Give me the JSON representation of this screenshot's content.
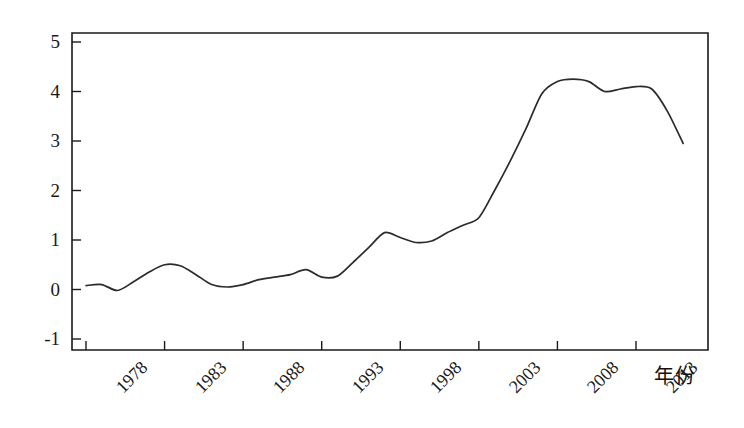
{
  "chart_data": {
    "type": "line",
    "title": "",
    "subtitle": "",
    "xlabel": "年份",
    "ylabel": "",
    "xlim": [
      1978,
      2016
    ],
    "ylim": [
      -1,
      5.2
    ],
    "grid": false,
    "legend": null,
    "legend_position": "none",
    "line_color": "#2b2b2b",
    "axis_color": "#1a1a1a",
    "background_color": "#ffffff",
    "yticks": [
      5,
      4,
      3,
      2,
      1,
      0,
      -1
    ],
    "ytick_labels": [
      "5",
      "4",
      "3",
      "2",
      "1",
      "0",
      "-1"
    ],
    "xticks": [
      1978,
      1983,
      1988,
      1993,
      1998,
      2003,
      2008,
      2013
    ],
    "xtick_labels": [
      "1978",
      "1983",
      "1988",
      "1993",
      "1998",
      "2003",
      "2008",
      "2013"
    ],
    "x": [
      1978,
      1979,
      1980,
      1981,
      1982,
      1983,
      1984,
      1985,
      1986,
      1987,
      1988,
      1989,
      1990,
      1991,
      1992,
      1993,
      1994,
      1995,
      1996,
      1997,
      1998,
      1999,
      2000,
      2001,
      2002,
      2003,
      2004,
      2005,
      2006,
      2007,
      2008,
      2009,
      2010,
      2011,
      2012,
      2013,
      2014,
      2015,
      2016
    ],
    "series": [
      {
        "name": "",
        "values": [
          0.08,
          0.1,
          -0.02,
          0.15,
          0.35,
          0.5,
          0.48,
          0.3,
          0.1,
          0.05,
          0.1,
          0.2,
          0.25,
          0.3,
          0.4,
          0.25,
          0.27,
          0.55,
          0.85,
          1.15,
          1.05,
          0.95,
          0.98,
          1.15,
          1.3,
          1.45,
          2.0,
          2.6,
          3.25,
          3.95,
          4.2,
          4.25,
          4.2,
          4.0,
          4.05,
          4.1,
          4.05,
          3.6,
          2.95
        ]
      }
    ]
  }
}
